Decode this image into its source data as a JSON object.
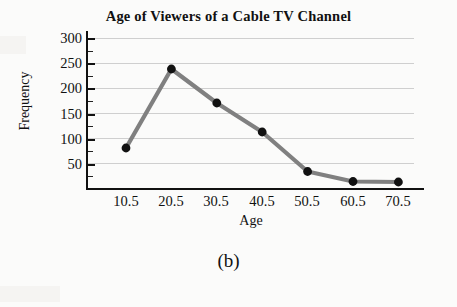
{
  "figure": {
    "caption": "(b)",
    "title": "Age of Viewers of a Cable TV Channel"
  },
  "axes": {
    "x_title": "Age",
    "y_title": "Frequency",
    "y_ticks": [
      "50",
      "100",
      "150",
      "200",
      "250",
      "300"
    ],
    "x_ticks": [
      "10.5",
      "20.5",
      "30.5",
      "40.5",
      "50.5",
      "60.5",
      "70.5"
    ]
  },
  "style": {
    "line_color": "#808080",
    "marker_color": "#111111",
    "grid_color": "#cfcfcf",
    "axis_color": "#111111",
    "background": "#fbfbfa"
  },
  "chart_data": {
    "type": "line",
    "title": "Age of Viewers of a Cable TV Channel",
    "xlabel": "Age",
    "ylabel": "Frequency",
    "categories": [
      "10.5",
      "20.5",
      "30.5",
      "40.5",
      "50.5",
      "60.5",
      "70.5"
    ],
    "x": [
      10.5,
      20.5,
      30.5,
      40.5,
      50.5,
      60.5,
      70.5
    ],
    "values": [
      80,
      238,
      170,
      112,
      33,
      13,
      12
    ],
    "series": [
      {
        "name": "Frequency",
        "values": [
          80,
          238,
          170,
          112,
          33,
          13,
          12
        ]
      }
    ],
    "ylim": [
      0,
      300
    ],
    "ytick_values": [
      50,
      100,
      150,
      200,
      250,
      300
    ],
    "xlim": [
      0.5,
      80.5
    ],
    "grid": "horizontal",
    "legend": "none",
    "markers": "filled-circle",
    "annotations": [
      "(b)"
    ]
  }
}
